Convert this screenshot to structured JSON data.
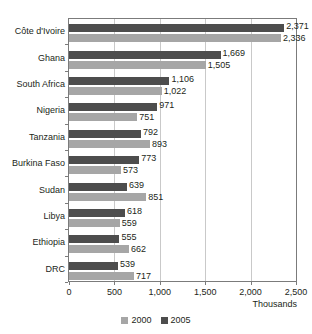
{
  "chart_data": {
    "type": "bar",
    "orientation": "horizontal",
    "title": "",
    "xlabel": "Thousands",
    "ylabel": "",
    "xlim": [
      0,
      2500
    ],
    "xticks": [
      "0",
      "500",
      "1,000",
      "1,500",
      "2,000",
      "2,500"
    ],
    "xtick_values": [
      0,
      500,
      1000,
      1500,
      2000,
      2500
    ],
    "grid": true,
    "legend_position": "bottom-center",
    "categories": [
      "Côte d'Ivoire",
      "Ghana",
      "South Africa",
      "Nigeria",
      "Tanzania",
      "Burkina Faso",
      "Sudan",
      "Libya",
      "Ethiopia",
      "DRC"
    ],
    "series": [
      {
        "name": "2000",
        "color": "#a6a6a6",
        "values": [
          2336,
          1505,
          1022,
          751,
          893,
          573,
          851,
          559,
          662,
          717
        ],
        "labels": [
          "2,336",
          "1,505",
          "1,022",
          "751",
          "893",
          "573",
          "851",
          "559",
          "662",
          "717"
        ]
      },
      {
        "name": "2005",
        "color": "#4d4d4d",
        "values": [
          2371,
          1669,
          1106,
          971,
          792,
          773,
          639,
          618,
          555,
          539
        ],
        "labels": [
          "2,371",
          "1,669",
          "1,106",
          "971",
          "792",
          "773",
          "639",
          "618",
          "555",
          "539"
        ]
      }
    ]
  },
  "axis": {
    "x_title": "Thousands"
  },
  "legend": {
    "items": [
      {
        "label": "2000",
        "color": "#a6a6a6"
      },
      {
        "label": "2005",
        "color": "#4d4d4d"
      }
    ]
  }
}
